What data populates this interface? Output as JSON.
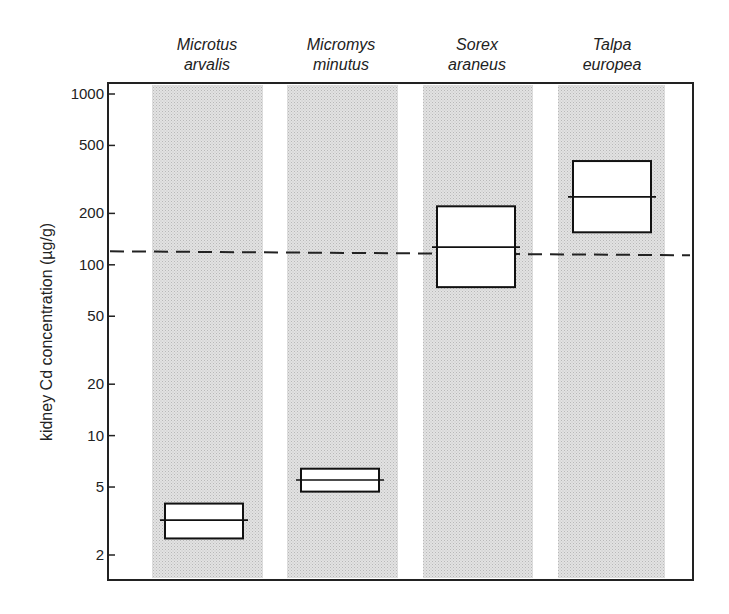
{
  "chart_data": {
    "type": "box",
    "title": "",
    "xlabel": "",
    "ylabel": "kidney Cd concentration (µg/g)",
    "yscale": "log",
    "ylim": [
      1.5,
      1150
    ],
    "yticks": [
      1000,
      500,
      200,
      100,
      50,
      20,
      10,
      5,
      2
    ],
    "ytick_labels": [
      "1000",
      "500",
      "200",
      "100",
      "50",
      "20",
      "10",
      "5",
      "2"
    ],
    "categories": [
      {
        "line1": "Microtus",
        "line2": "arvalis"
      },
      {
        "line1": "Micromys",
        "line2": "minutus"
      },
      {
        "line1": "Sorex",
        "line2": "araneus"
      },
      {
        "line1": "Talpa",
        "line2": "europea"
      }
    ],
    "boxes": [
      {
        "species": "Microtus arvalis",
        "low": 2.5,
        "median": 3.2,
        "high": 4.0
      },
      {
        "species": "Micromys minutus",
        "low": 4.7,
        "median": 5.5,
        "high": 6.4
      },
      {
        "species": "Sorex araneus",
        "low": 74,
        "median": 127,
        "high": 220
      },
      {
        "species": "Talpa europea",
        "low": 155,
        "median": 250,
        "high": 405
      }
    ],
    "reference_line": {
      "value": 120,
      "style": "dashed"
    },
    "grid": false,
    "legend": "none",
    "background_bands": "stippled grey columns per species"
  }
}
